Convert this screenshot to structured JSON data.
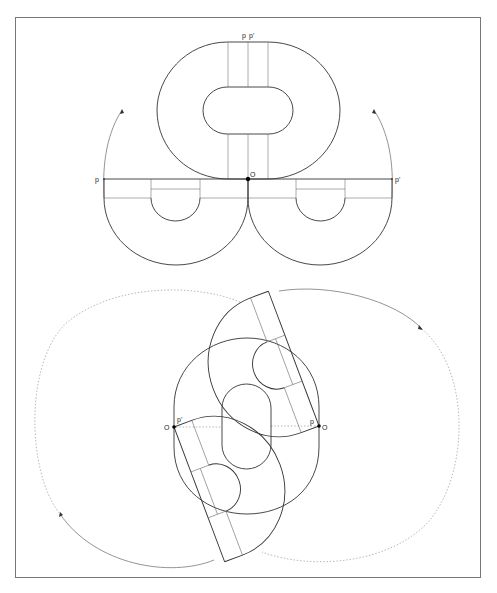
{
  "figure": {
    "type": "geometric-construction-diagram",
    "top_panel": {
      "labels": {
        "p_top": "p",
        "p_prime_top": "p'",
        "origin": "O",
        "p_left": "p",
        "p_prime_right": "p'"
      }
    },
    "bottom_panel": {
      "labels": {
        "origin_left": "O",
        "p_prime_left": "p'",
        "p_right": "p",
        "origin_right": "O"
      }
    }
  }
}
